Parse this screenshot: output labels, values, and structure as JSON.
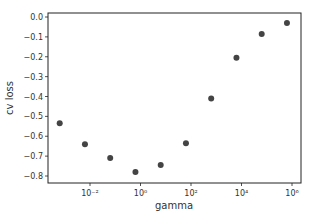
{
  "chart_data": {
    "type": "scatter",
    "title": "",
    "xlabel": "gamma",
    "ylabel": "cv loss",
    "xscale": "log",
    "xlim_log10": [
      -3.7,
      6.35
    ],
    "ylim": [
      -0.835,
      0.02
    ],
    "grid": false,
    "legend": null,
    "marker_color": "#444444",
    "x_ticks": [
      {
        "label": "10⁻²",
        "log10": -2
      },
      {
        "label": "10⁰",
        "log10": 0
      },
      {
        "label": "10²",
        "log10": 2
      },
      {
        "label": "10⁴",
        "log10": 4
      },
      {
        "label": "10⁶",
        "log10": 6
      }
    ],
    "y_ticks": [
      {
        "label": "0.0",
        "value": 0.0
      },
      {
        "label": "−0.1",
        "value": -0.1
      },
      {
        "label": "−0.2",
        "value": -0.2
      },
      {
        "label": "−0.3",
        "value": -0.3
      },
      {
        "label": "−0.4",
        "value": -0.4
      },
      {
        "label": "−0.5",
        "value": -0.5
      },
      {
        "label": "−0.6",
        "value": -0.6
      },
      {
        "label": "−0.7",
        "value": -0.7
      },
      {
        "label": "−0.8",
        "value": -0.8
      }
    ],
    "points": [
      {
        "gamma_log10": -3.2,
        "cv_loss": -0.535
      },
      {
        "gamma_log10": -2.2,
        "cv_loss": -0.64
      },
      {
        "gamma_log10": -1.2,
        "cv_loss": -0.71
      },
      {
        "gamma_log10": -0.2,
        "cv_loss": -0.78
      },
      {
        "gamma_log10": 0.8,
        "cv_loss": -0.745
      },
      {
        "gamma_log10": 1.8,
        "cv_loss": -0.635
      },
      {
        "gamma_log10": 2.8,
        "cv_loss": -0.41
      },
      {
        "gamma_log10": 3.8,
        "cv_loss": -0.205
      },
      {
        "gamma_log10": 4.8,
        "cv_loss": -0.085
      },
      {
        "gamma_log10": 5.8,
        "cv_loss": -0.03
      }
    ]
  }
}
